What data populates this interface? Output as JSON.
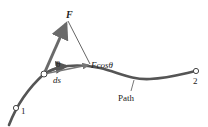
{
  "diagram": {
    "labels": {
      "force": "F",
      "angle": "θ",
      "component": "Fcosθ",
      "displacement": "ds",
      "start_point": "1",
      "end_point": "2",
      "path": "Path"
    },
    "colors": {
      "path": "#555555",
      "force_arrow": "#6a6a6a",
      "component_arrow": "#777777",
      "text": "#222222"
    }
  }
}
